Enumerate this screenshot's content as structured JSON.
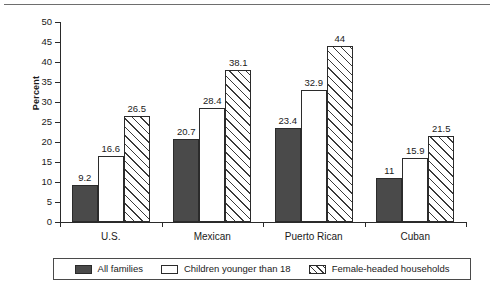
{
  "chart_data": {
    "type": "bar",
    "title": "",
    "xlabel": "",
    "ylabel": "Percent",
    "ylim": [
      0,
      50
    ],
    "ytick_step": 5,
    "yticks": [
      "50",
      "45",
      "40",
      "35",
      "30",
      "25",
      "20",
      "15",
      "10",
      "5",
      "0"
    ],
    "grid": false,
    "legend_position": "bottom",
    "categories": [
      "U.S.",
      "Mexican",
      "Puerto Rican",
      "Cuban"
    ],
    "series": [
      {
        "name": "All families",
        "pattern": "solid",
        "color": "#4a4a4a",
        "values": [
          9.2,
          20.7,
          23.4,
          11
        ],
        "labels": [
          "9.2",
          "20.7",
          "23.4",
          "11"
        ]
      },
      {
        "name": "Children younger than 18",
        "pattern": "open",
        "color": "#ffffff",
        "values": [
          16.6,
          28.4,
          32.9,
          15.9
        ],
        "labels": [
          "16.6",
          "28.4",
          "32.9",
          "15.9"
        ]
      },
      {
        "name": "Female-headed households",
        "pattern": "hatch",
        "color": "#ffffff",
        "values": [
          26.5,
          38.1,
          44,
          21.5
        ],
        "labels": [
          "26.5",
          "38.1",
          "44",
          "21.5"
        ]
      }
    ]
  },
  "legend": {
    "items": [
      {
        "label": "All families",
        "pattern": "solid"
      },
      {
        "label": "Children younger than 18",
        "pattern": "open"
      },
      {
        "label": "Female-headed households",
        "pattern": "hatch"
      }
    ]
  }
}
